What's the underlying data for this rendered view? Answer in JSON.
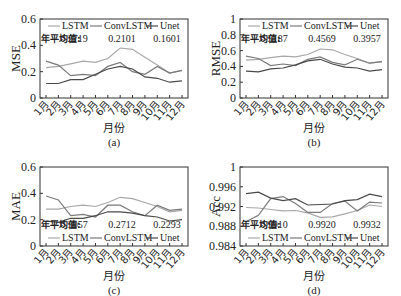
{
  "chart_data": [
    {
      "id": "a",
      "type": "line",
      "caption": "(a)",
      "ylabel": "MSE",
      "xlabel": "月份",
      "categories": [
        "1月",
        "2月",
        "3月",
        "4月",
        "5月",
        "6月",
        "7月",
        "8月",
        "9月",
        "10月",
        "11月",
        "12月"
      ],
      "ylim": [
        0,
        0.6
      ],
      "yticks": [
        "0",
        "0.2",
        "0.4",
        "0.6"
      ],
      "yticks_values": [
        0,
        0.2,
        0.4,
        0.6
      ],
      "legend": [
        "LSTM",
        "ConvLSTM",
        "Unet"
      ],
      "legend_position": "top",
      "annual_mean_label": "年平均值:",
      "annual_means": [
        "0.2719",
        "0.2101",
        "0.1601"
      ],
      "series": [
        {
          "name": "LSTM",
          "color": "#a8a8a8",
          "values": [
            0.23,
            0.24,
            0.26,
            0.28,
            0.27,
            0.3,
            0.38,
            0.37,
            0.31,
            0.25,
            0.19,
            0.21
          ]
        },
        {
          "name": "ConvLSTM",
          "color": "#7a7a7a",
          "values": [
            0.28,
            0.25,
            0.17,
            0.18,
            0.17,
            0.24,
            0.27,
            0.2,
            0.18,
            0.24,
            0.19,
            0.21
          ]
        },
        {
          "name": "Unet",
          "color": "#4a4a4a",
          "values": [
            0.11,
            0.11,
            0.14,
            0.14,
            0.18,
            0.22,
            0.24,
            0.22,
            0.16,
            0.15,
            0.12,
            0.13
          ]
        }
      ]
    },
    {
      "id": "b",
      "type": "line",
      "caption": "(b)",
      "ylabel": "RMSE",
      "xlabel": "月份",
      "categories": [
        "1月",
        "2月",
        "3月",
        "4月",
        "5月",
        "6月",
        "7月",
        "8月",
        "9月",
        "10月",
        "11月",
        "12月"
      ],
      "ylim": [
        0,
        1
      ],
      "yticks": [
        "0",
        "0.2",
        "0.4",
        "0.6",
        "0.8",
        "1"
      ],
      "yticks_values": [
        0,
        0.2,
        0.4,
        0.6,
        0.8,
        1.0
      ],
      "legend": [
        "LSTM",
        "ConvLSTM",
        "Unet"
      ],
      "legend_position": "top",
      "annual_mean_label": "年平均值:",
      "annual_means": [
        "0.5187",
        "0.4569",
        "0.3957"
      ],
      "series": [
        {
          "name": "LSTM",
          "color": "#a8a8a8",
          "values": [
            0.48,
            0.49,
            0.51,
            0.53,
            0.52,
            0.55,
            0.62,
            0.61,
            0.55,
            0.5,
            0.44,
            0.46
          ]
        },
        {
          "name": "ConvLSTM",
          "color": "#7a7a7a",
          "values": [
            0.53,
            0.5,
            0.41,
            0.43,
            0.41,
            0.49,
            0.52,
            0.45,
            0.42,
            0.49,
            0.44,
            0.46
          ]
        },
        {
          "name": "Unet",
          "color": "#4a4a4a",
          "values": [
            0.34,
            0.33,
            0.37,
            0.38,
            0.42,
            0.47,
            0.49,
            0.43,
            0.39,
            0.38,
            0.34,
            0.36
          ]
        }
      ]
    },
    {
      "id": "c",
      "type": "line",
      "caption": "(c)",
      "ylabel": "MAE",
      "xlabel": "月份",
      "categories": [
        "1月",
        "2月",
        "3月",
        "4月",
        "5月",
        "6月",
        "7月",
        "8月",
        "9月",
        "10月",
        "11月",
        "12月"
      ],
      "ylim": [
        0,
        0.6
      ],
      "yticks": [
        "0",
        "0.2",
        "0.4",
        "0.6"
      ],
      "yticks_values": [
        0,
        0.2,
        0.4,
        0.6
      ],
      "legend": [
        "LSTM",
        "ConvLSTM",
        "Unet"
      ],
      "legend_position": "bottom-inside",
      "annual_mean_label": "年平均值:",
      "annual_means": [
        "0.3057",
        "0.2712",
        "0.2293"
      ],
      "series": [
        {
          "name": "LSTM",
          "color": "#a8a8a8",
          "values": [
            0.28,
            0.28,
            0.3,
            0.31,
            0.3,
            0.33,
            0.37,
            0.36,
            0.33,
            0.3,
            0.26,
            0.27
          ]
        },
        {
          "name": "ConvLSTM",
          "color": "#7a7a7a",
          "values": [
            0.38,
            0.35,
            0.23,
            0.24,
            0.22,
            0.31,
            0.31,
            0.26,
            0.23,
            0.31,
            0.27,
            0.28
          ]
        },
        {
          "name": "Unet",
          "color": "#4a4a4a",
          "values": [
            0.19,
            0.18,
            0.21,
            0.21,
            0.23,
            0.26,
            0.26,
            0.25,
            0.23,
            0.22,
            0.19,
            0.2
          ]
        }
      ]
    },
    {
      "id": "d",
      "type": "line",
      "caption": "(d)",
      "ylabel": "Acc",
      "xlabel": "月份",
      "categories": [
        "1月",
        "2月",
        "3月",
        "4月",
        "5月",
        "6月",
        "7月",
        "8月",
        "9月",
        "10月",
        "11月",
        "12月"
      ],
      "ylim": [
        0.984,
        1
      ],
      "yticks": [
        "0.984",
        "0.988",
        "0.992",
        "0.996",
        "1"
      ],
      "yticks_values": [
        0.984,
        0.988,
        0.992,
        0.996,
        1.0
      ],
      "legend": [
        "LSTM",
        "ConvLSTM",
        "Unet"
      ],
      "legend_position": "bottom-inside",
      "annual_mean_label": "年平均值:",
      "annual_means": [
        "0.9910",
        "0.9920",
        "0.9932"
      ],
      "series": [
        {
          "name": "LSTM",
          "color": "#a8a8a8",
          "values": [
            0.9918,
            0.9917,
            0.9914,
            0.9911,
            0.9912,
            0.9907,
            0.9898,
            0.9899,
            0.9905,
            0.9912,
            0.9923,
            0.992
          ]
        },
        {
          "name": "ConvLSTM",
          "color": "#7a7a7a",
          "values": [
            0.9889,
            0.9902,
            0.9936,
            0.994,
            0.9926,
            0.9908,
            0.9908,
            0.9926,
            0.9931,
            0.9911,
            0.9929,
            0.9927
          ]
        },
        {
          "name": "Unet",
          "color": "#4a4a4a",
          "values": [
            0.9946,
            0.9949,
            0.9937,
            0.9932,
            0.9936,
            0.9923,
            0.9924,
            0.9925,
            0.9932,
            0.9934,
            0.9945,
            0.994
          ]
        }
      ]
    }
  ]
}
